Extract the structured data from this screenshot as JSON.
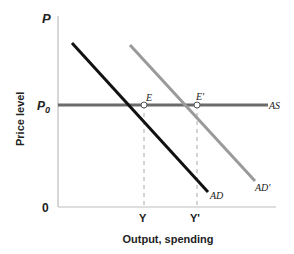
{
  "diagram": {
    "title": "",
    "y_axis": {
      "top_label": "P",
      "label": "Price level",
      "p0_label": "P",
      "p0_subscript": "0",
      "origin_label": "0"
    },
    "x_axis": {
      "label": "Output, spending",
      "ticks": [
        "Y",
        "Y'"
      ]
    },
    "curves": {
      "as": {
        "label": "AS",
        "color": "#6b6b6b"
      },
      "ad": {
        "label": "AD",
        "color": "#111111"
      },
      "ad_prime": {
        "label": "AD'",
        "color": "#9a9a9a"
      }
    },
    "points": {
      "e": {
        "label": "E"
      },
      "e_prime": {
        "label": "E'"
      }
    }
  }
}
